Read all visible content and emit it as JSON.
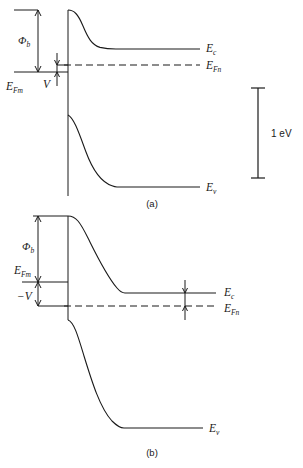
{
  "figure": {
    "background_color": "#ffffff",
    "line_color": "#1a1a1a",
    "width": 303,
    "height": 468
  },
  "panels": [
    {
      "id": "a",
      "caption": "(a)",
      "condition": "forward bias V",
      "labels": {
        "barrier": "Φ",
        "barrier_sub": "b",
        "metal_fermi": "E",
        "metal_fermi_sub": "Fm",
        "bias": "V",
        "conduction": "E",
        "conduction_sub": "c",
        "semi_fermi": "E",
        "semi_fermi_sub": "Fn",
        "valence": "E",
        "valence_sub": "v"
      },
      "geometry": {
        "interface_x": 68,
        "band_top_y": 10,
        "ec_flat_y": 49,
        "efn_y": 65,
        "efm_y": 72,
        "ev_flat_y": 187,
        "flat_start_x": 116,
        "right_x": 200
      }
    },
    {
      "id": "b",
      "caption": "(b)",
      "condition": "reverse bias -V",
      "labels": {
        "barrier": "Φ",
        "barrier_sub": "b",
        "metal_fermi": "E",
        "metal_fermi_sub": "Fm",
        "bias": "−V",
        "conduction": "E",
        "conduction_sub": "c",
        "semi_fermi": "E",
        "semi_fermi_sub": "Fn",
        "valence": "E",
        "valence_sub": "v"
      },
      "geometry": {
        "interface_x": 68,
        "band_top_y": 216,
        "efm_y": 282,
        "ec_flat_y": 293,
        "efn_y": 306,
        "ev_flat_y": 428,
        "flat_start_x": 118,
        "right_x": 216
      }
    }
  ],
  "scale_bar": {
    "label": "1 eV",
    "top_y": 88,
    "bottom_y": 178,
    "x": 258,
    "label_x": 272,
    "label_y": 134
  }
}
